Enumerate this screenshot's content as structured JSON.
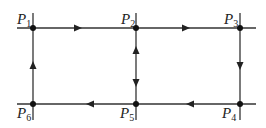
{
  "diagram": {
    "type": "directed-graph",
    "colors": {
      "line": "#333333",
      "node": "#111111",
      "background": "#ffffff"
    },
    "nodes": [
      {
        "id": "P1",
        "label": "P",
        "sub": "1",
        "x": 33,
        "y": 28
      },
      {
        "id": "P2",
        "label": "P",
        "sub": "2",
        "x": 136,
        "y": 28
      },
      {
        "id": "P3",
        "label": "P",
        "sub": "3",
        "x": 240,
        "y": 28
      },
      {
        "id": "P4",
        "label": "P",
        "sub": "4",
        "x": 240,
        "y": 104
      },
      {
        "id": "P5",
        "label": "P",
        "sub": "5",
        "x": 136,
        "y": 104
      },
      {
        "id": "P6",
        "label": "P",
        "sub": "6",
        "x": 33,
        "y": 104
      }
    ],
    "edges": [
      {
        "from": "P1",
        "to": "P2",
        "direction": "right"
      },
      {
        "from": "P2",
        "to": "P3",
        "direction": "right"
      },
      {
        "from": "P3",
        "to": "P4",
        "direction": "down"
      },
      {
        "from": "P4",
        "to": "P5",
        "direction": "left"
      },
      {
        "from": "P5",
        "to": "P6",
        "direction": "left"
      },
      {
        "from": "P6",
        "to": "P1",
        "direction": "up"
      },
      {
        "from": "P2",
        "to": "P5",
        "direction": "bidirectional"
      }
    ]
  }
}
